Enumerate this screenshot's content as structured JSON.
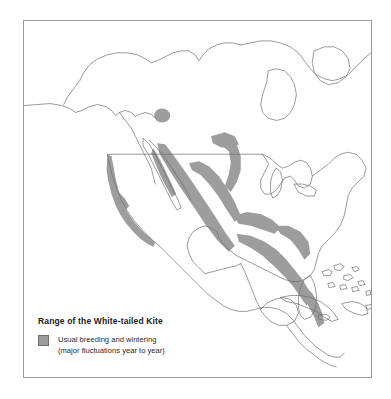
{
  "figure": {
    "type": "range-map",
    "subject": "White-tailed Kite",
    "region_depicted": "North America, Central America and the Caribbean",
    "background_color": "#ffffff",
    "frame_color": "#9b9b9b",
    "coastline_color": "#6e6e6e"
  },
  "legend": {
    "title": "Range of the White-tailed Kite",
    "swatch_color": "#9d9d9d",
    "swatch_border_color": "#6e6e6e",
    "entries": [
      {
        "label_line_1": "Usual breeding and wintering",
        "label_line_2": "(major fluctuations year to year)"
      }
    ]
  },
  "map_content": {
    "shaded_areas": [
      "Pacific coast strip from western Oregon south through California",
      "Isolated spot in southern Arizona",
      "Baja California peninsula southern portion",
      "Pacific slope of mainland Mexico",
      "Interior and eastern Mexico lowlands",
      "Southern Texas / lower Rio Grande wedge",
      "Yucatan and Gulf coastal Mexico",
      "Central America through Panama"
    ],
    "unshaded_areas": [
      "Alaska",
      "Canada",
      "Northern and eastern United States",
      "Florida",
      "Cuba, Hispaniola, Jamaica, Puerto Rico and Lesser Antilles"
    ]
  }
}
